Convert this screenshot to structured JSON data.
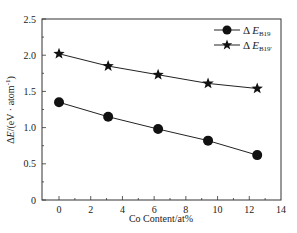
{
  "chart_data": {
    "type": "line",
    "title": "",
    "xlabel": "Co Content/at%",
    "ylabel": "ΔE/(eV · atom⁻¹)",
    "xlim": [
      -1.1,
      14
    ],
    "ylim": [
      0,
      2.5
    ],
    "xticks": [
      0,
      2,
      4,
      6,
      8,
      10,
      12,
      14
    ],
    "yticks": [
      0,
      0.5,
      1.0,
      1.5,
      2.0,
      2.5
    ],
    "ytick_labels": [
      "0",
      "0.5",
      "1.0",
      "1.5",
      "2.0",
      "2.5"
    ],
    "grid": false,
    "legend_position": "upper right",
    "series": [
      {
        "name": "ΔE_B19",
        "legend_main": "Δ E",
        "legend_sub": "B19",
        "marker": "circle",
        "x": [
          0,
          3.1,
          6.25,
          9.4,
          12.5
        ],
        "values": [
          1.35,
          1.15,
          0.98,
          0.82,
          0.62
        ]
      },
      {
        "name": "ΔE_B19'",
        "legend_main": "Δ E",
        "legend_sub": "B19'",
        "marker": "star",
        "x": [
          0,
          3.1,
          6.25,
          9.4,
          12.5
        ],
        "values": [
          2.02,
          1.85,
          1.73,
          1.61,
          1.54
        ]
      }
    ]
  }
}
